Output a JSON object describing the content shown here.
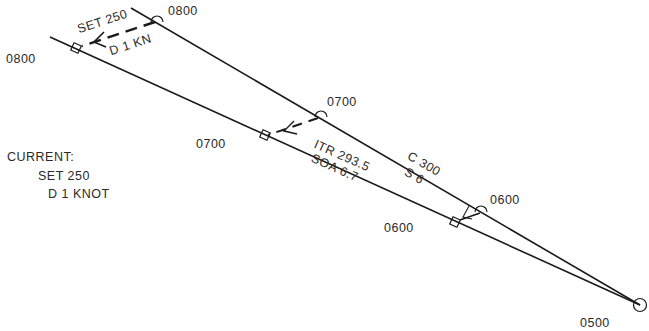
{
  "diagram": {
    "type": "current_sailing_plot",
    "legend": {
      "title": "CURRENT:",
      "set": "SET 250",
      "drift": "D  1  KNOT"
    },
    "dr_track": {
      "course_label": "C 300",
      "speed_label": "S 6",
      "times": [
        "0500",
        "0600",
        "0700",
        "0800"
      ]
    },
    "intended_track": {
      "itr_label": "ITR  293.5",
      "soa_label": "SOA  6.7",
      "times": [
        "0600",
        "0700",
        "0800"
      ]
    },
    "current_vector": {
      "set_label": "SET  250",
      "drift_label": "D  1 KN"
    },
    "colors": {
      "line": "#1a1a1a",
      "background": "#ffffff"
    }
  }
}
